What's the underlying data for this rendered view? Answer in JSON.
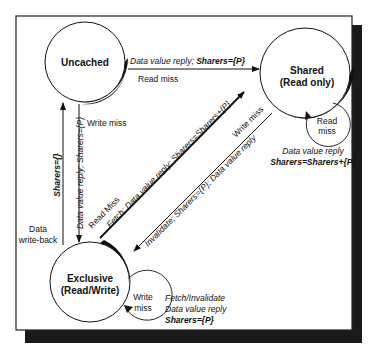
{
  "diagram": {
    "type": "state-transition",
    "states": {
      "uncached": {
        "label": "Uncached"
      },
      "shared": {
        "line1": "Shared",
        "line2": "(Read only)"
      },
      "exclusive": {
        "line1": "Exclusive",
        "line2": "(Read/Write)"
      }
    },
    "transitions": {
      "uncached_to_shared": {
        "action_prefix": "Data value reply; ",
        "action_bold": "Sharers={P}",
        "trigger": "Read miss"
      },
      "uncached_exclusive": {
        "trigger": "Write miss",
        "down_action": "Data value reply; Sharers={P}",
        "up_action": "Sharers={}",
        "writeback": [
          "Data",
          "write-back"
        ]
      },
      "exclusive_to_shared": {
        "trigger": "Read Miss",
        "action": "Fetch; Data value reply; Sharers=Sharers+{P}"
      },
      "shared_to_exclusive": {
        "trigger": "Write miss",
        "action": "Invalidate; Sharers={P}; Data value reply"
      },
      "shared_self": {
        "trigger": [
          "Read",
          "miss"
        ],
        "action": "Data value reply",
        "action_bold": "Sharers=Sharers+{P}"
      },
      "exclusive_self": {
        "trigger": [
          "Write",
          "miss"
        ],
        "action1": "Fetch/Invalidate",
        "action2": "Data value reply",
        "action_bold": "Sharers={P}"
      }
    }
  }
}
